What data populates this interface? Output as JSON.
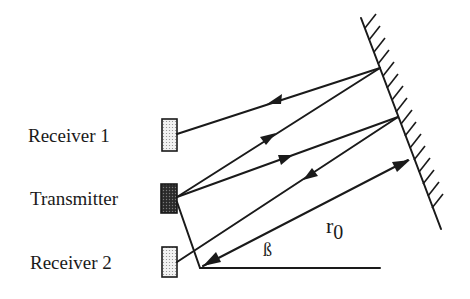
{
  "diagram": {
    "title": "",
    "labels": {
      "receiver1": "Receiver 1",
      "transmitter": "Transmitter",
      "receiver2": "Receiver 2",
      "range": "r",
      "range_subscript": "0",
      "angle": "ß"
    },
    "components": [
      {
        "id": "receiver1",
        "type": "receiver",
        "fill": "#e6e6e6"
      },
      {
        "id": "transmitter",
        "type": "transmitter",
        "fill": "#3a3a3a"
      },
      {
        "id": "receiver2",
        "type": "receiver",
        "fill": "#e6e6e6"
      },
      {
        "id": "reflector",
        "type": "reflecting-wall"
      }
    ],
    "paths": [
      {
        "from": "transmitter",
        "to": "reflector-point-1",
        "direction": "outgoing"
      },
      {
        "from": "reflector-point-1",
        "to": "receiver1",
        "direction": "incoming"
      },
      {
        "from": "transmitter",
        "to": "reflector-point-2",
        "direction": "outgoing"
      },
      {
        "from": "reflector-point-2",
        "to": "receiver2",
        "direction": "incoming"
      },
      {
        "from": "baseline-vertex",
        "to": "reflector",
        "direction": "both",
        "label": "r0"
      }
    ],
    "colors": {
      "ink": "#1a1a1a",
      "receiver_fill": "#e6e6e6",
      "transmitter_fill": "#3a3a3a",
      "background": "#ffffff"
    }
  }
}
